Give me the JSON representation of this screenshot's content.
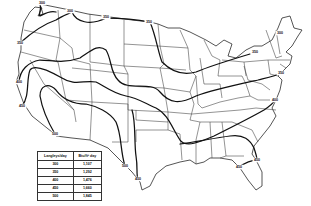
{
  "map": {
    "title": "Average daily solar radiation, contiguous United States",
    "units": "Langleys/day",
    "contour_labels": [
      {
        "value": "300",
        "x": 42,
        "y": 3
      },
      {
        "value": "300",
        "x": 70,
        "y": 11
      },
      {
        "value": "350",
        "x": 106,
        "y": 17
      },
      {
        "value": "350",
        "x": 149,
        "y": 22
      },
      {
        "value": "350",
        "x": 20,
        "y": 43
      },
      {
        "value": "400",
        "x": 19,
        "y": 82
      },
      {
        "value": "450",
        "x": 22,
        "y": 106
      },
      {
        "value": "500",
        "x": 55,
        "y": 134
      },
      {
        "value": "300",
        "x": 280,
        "y": 33
      },
      {
        "value": "350",
        "x": 255,
        "y": 52
      },
      {
        "value": "350",
        "x": 281,
        "y": 73
      },
      {
        "value": "400",
        "x": 275,
        "y": 100
      },
      {
        "value": "500",
        "x": 125,
        "y": 166
      },
      {
        "value": "450",
        "x": 138,
        "y": 179
      },
      {
        "value": "450",
        "x": 257,
        "y": 160
      },
      {
        "value": "450",
        "x": 239,
        "y": 167
      }
    ]
  },
  "legend": {
    "headers": [
      "Langleys/day",
      "Btu/ft² day"
    ],
    "rows": [
      {
        "langleys": "300",
        "btu": "1,107"
      },
      {
        "langleys": "350",
        "btu": "1,292"
      },
      {
        "langleys": "400",
        "btu": "1,476"
      },
      {
        "langleys": "450",
        "btu": "1,660"
      },
      {
        "langleys": "500",
        "btu": "1,845"
      }
    ]
  }
}
